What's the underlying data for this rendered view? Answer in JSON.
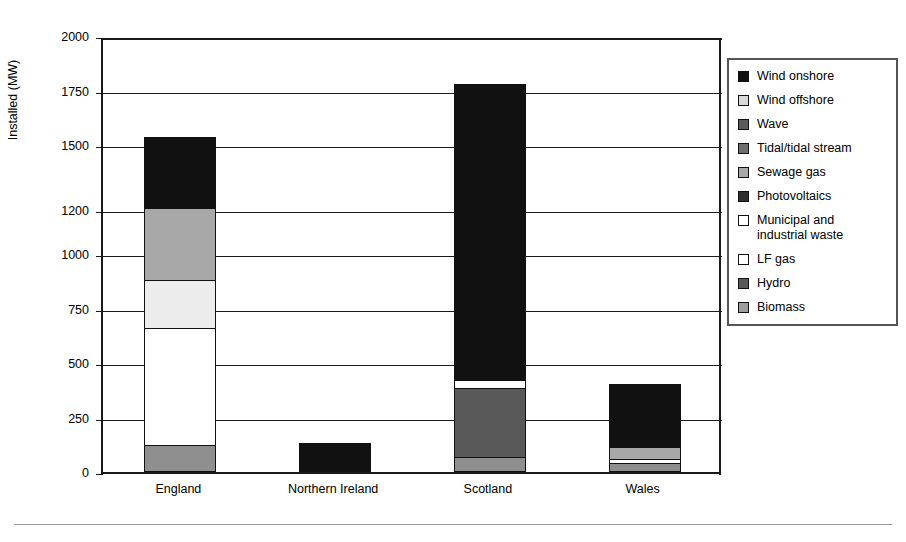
{
  "chart_data": {
    "type": "bar",
    "subtype": "stacked-bar",
    "title": "",
    "xlabel": "",
    "ylabel": "Installed (MW)",
    "ylim": [
      0,
      2000
    ],
    "ytick_labels": [
      "2000",
      "1750",
      "1500",
      "1200",
      "1000",
      "750",
      "500",
      "250",
      "0"
    ],
    "ytick_values": [
      2000,
      1750,
      1500,
      1200,
      1000,
      750,
      500,
      250,
      0
    ],
    "grid": true,
    "legend_position": "right",
    "categories": [
      "England",
      "Northern Ireland",
      "Scotland",
      "Wales"
    ],
    "series": [
      {
        "name": "Wind onshore",
        "color": "#111111",
        "values": [
          325,
          135,
          1360,
          290
        ]
      },
      {
        "name": "Wind offshore",
        "color": "#d9d9d9",
        "values": [
          0,
          0,
          0,
          0
        ]
      },
      {
        "name": "Wave",
        "color": "#5a5a5a",
        "values": [
          0,
          0,
          0,
          0
        ]
      },
      {
        "name": "Tidal/tidal stream",
        "color": "#6e6e6e",
        "values": [
          0,
          0,
          0,
          0
        ]
      },
      {
        "name": "Sewage gas",
        "color": "#a8a8a8",
        "values": [
          330,
          0,
          0,
          55
        ]
      },
      {
        "name": "Photovoltaics",
        "color": "#2e2e2e",
        "values": [
          0,
          0,
          0,
          0
        ]
      },
      {
        "name": "Municipal and industrial waste",
        "color": "#ececec",
        "values": [
          220,
          0,
          0,
          0
        ]
      },
      {
        "name": "LF gas",
        "color": "#ffffff",
        "values": [
          535,
          0,
          35,
          20
        ]
      },
      {
        "name": "Hydro",
        "color": "#595959",
        "values": [
          0,
          0,
          315,
          0
        ]
      },
      {
        "name": "Biomass",
        "color": "#8f8f8f",
        "values": [
          125,
          0,
          70,
          40
        ]
      }
    ],
    "totals": [
      1535,
      135,
      1780,
      405
    ]
  },
  "axis": {
    "y_title": "Installed (MW)",
    "ticks": [
      {
        "label": "2000",
        "value": 2000
      },
      {
        "label": "1750",
        "value": 1750
      },
      {
        "label": "1500",
        "value": 1500
      },
      {
        "label": "1200",
        "value": 1200
      },
      {
        "label": "1000",
        "value": 1000
      },
      {
        "label": "750",
        "value": 750
      },
      {
        "label": "500",
        "value": 500
      },
      {
        "label": "250",
        "value": 250
      },
      {
        "label": "0",
        "value": 0
      }
    ],
    "categories": [
      {
        "label": "England"
      },
      {
        "label": "Northern Ireland"
      },
      {
        "label": "Scotland"
      },
      {
        "label": "Wales"
      }
    ]
  },
  "legend": {
    "items": [
      {
        "label": "Wind onshore",
        "color": "#111111"
      },
      {
        "label": "Wind offshore",
        "color": "#d9d9d9"
      },
      {
        "label": "Wave",
        "color": "#5a5a5a"
      },
      {
        "label": "Tidal/tidal stream",
        "color": "#6e6e6e"
      },
      {
        "label": "Sewage gas",
        "color": "#a8a8a8"
      },
      {
        "label": "Photovoltaics",
        "color": "#2e2e2e"
      },
      {
        "label": "Municipal and\nindustrial waste",
        "color": "#ffffff"
      },
      {
        "label": "LF gas",
        "color": "#ffffff"
      },
      {
        "label": "Hydro",
        "color": "#595959"
      },
      {
        "label": "Biomass",
        "color": "#9d9d9d"
      }
    ]
  }
}
